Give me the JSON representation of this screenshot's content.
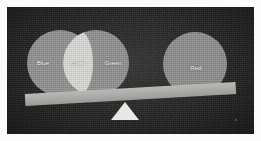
{
  "scene": {
    "title": "Balance scale comparing overlapping color circles",
    "background_color": "#262626",
    "frame_color": "#fbfbfb"
  },
  "venn": {
    "description": "Two overlapping circles forming a lens-shaped intersection",
    "circles": [
      {
        "id": "blue",
        "label": "Blue",
        "color": "#8d8d8d",
        "side": "left-pan"
      },
      {
        "id": "green",
        "label": "Green",
        "color": "#8d8d8d",
        "side": "left-pan"
      }
    ],
    "intersection": {
      "id": "cyan",
      "label": "Cyan",
      "color": "#d9d9d6"
    }
  },
  "right_pan": {
    "circle": {
      "id": "red",
      "label": "Red",
      "color": "#8a8a8a"
    }
  },
  "balance": {
    "beam_color": "#b9b9b5",
    "fulcrum_color": "#e8e8e4",
    "tilt_degrees": -3.2,
    "heavier_side": "left"
  }
}
